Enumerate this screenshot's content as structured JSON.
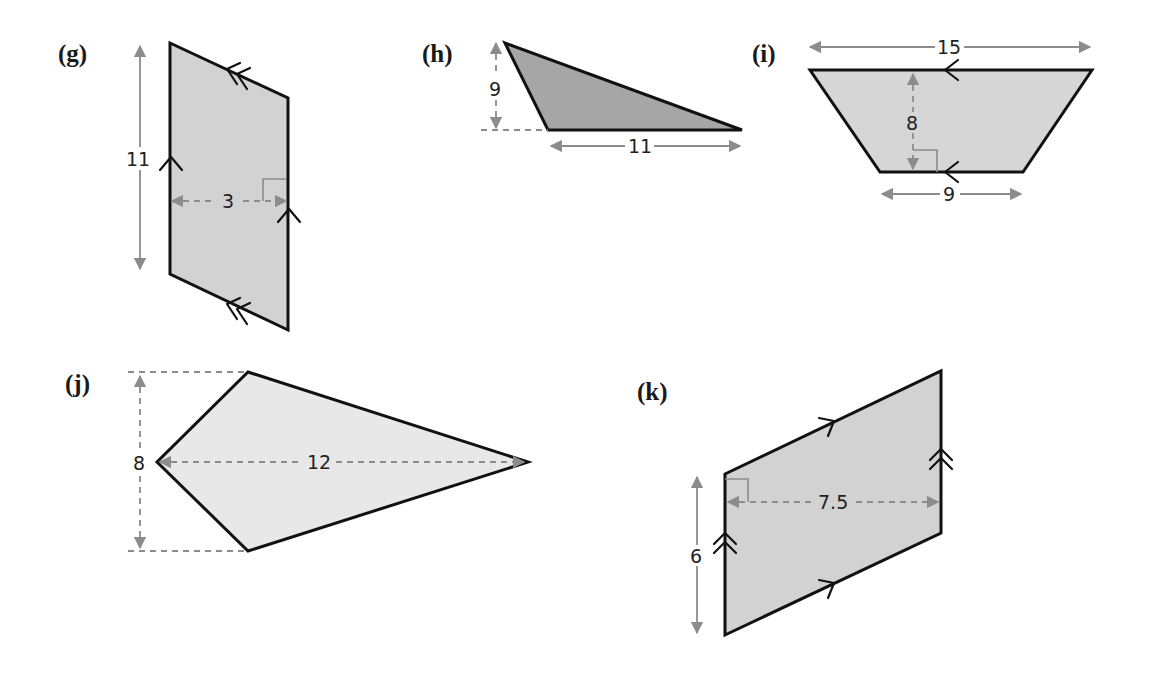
{
  "figures": [
    {
      "id": "g",
      "label": "(g)",
      "shape": "parallelogram",
      "fill": "#d2d2d2",
      "dimensions": {
        "height_label": "11",
        "width_label": "3"
      }
    },
    {
      "id": "h",
      "label": "(h)",
      "shape": "triangle",
      "fill": "#a6a6a6",
      "dimensions": {
        "height_label": "9",
        "base_label": "11"
      }
    },
    {
      "id": "i",
      "label": "(i)",
      "shape": "trapezium",
      "fill": "#d6d6d6",
      "dimensions": {
        "top_label": "15",
        "height_label": "8",
        "bottom_label": "9"
      }
    },
    {
      "id": "j",
      "label": "(j)",
      "shape": "kite",
      "fill": "#e8e8e8",
      "dimensions": {
        "height_label": "8",
        "width_label": "12"
      }
    },
    {
      "id": "k",
      "label": "(k)",
      "shape": "parallelogram",
      "fill": "#d2d2d2",
      "dimensions": {
        "side_label": "6",
        "width_label": "7.5"
      }
    }
  ],
  "colors": {
    "outline": "#111111",
    "dimension_arrow": "#8c8c8c"
  }
}
